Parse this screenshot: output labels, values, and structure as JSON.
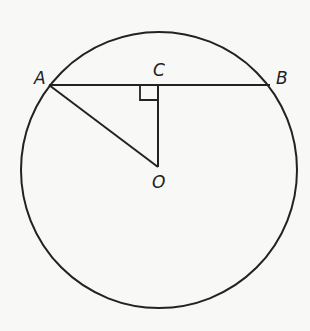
{
  "diagram": {
    "type": "circle-chord-geometry",
    "colors": {
      "stroke": "#222222",
      "background": "#f8f8f6"
    },
    "circle": {
      "center_label": "O",
      "cx": 159,
      "cy": 170,
      "r": 138
    },
    "points": [
      {
        "label": "A",
        "x": 49,
        "y": 85
      },
      {
        "label": "B",
        "x": 270,
        "y": 85
      },
      {
        "label": "C",
        "x": 158,
        "y": 85
      },
      {
        "label": "O",
        "x": 158,
        "y": 167
      }
    ],
    "segments": [
      {
        "from": "A",
        "to": "B",
        "name": "chord-AB"
      },
      {
        "from": "A",
        "to": "O",
        "name": "radius-AO"
      },
      {
        "from": "C",
        "to": "O",
        "name": "perpendicular-CO"
      }
    ],
    "annotations": [
      {
        "type": "right-angle",
        "at": "C"
      }
    ],
    "labels": {
      "A": "A",
      "B": "B",
      "C": "C",
      "O": "O"
    }
  }
}
